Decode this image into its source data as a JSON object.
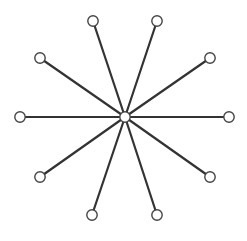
{
  "diagram": {
    "type": "star-graph",
    "width": 247,
    "height": 241,
    "background": "#ffffff",
    "edge_color": "#333333",
    "edge_width": 2.2,
    "node_fill": "#ffffff",
    "node_stroke": "#444444",
    "node_stroke_width": 1.4,
    "node_radius": 5.2,
    "center": {
      "id": "hub",
      "x": 125,
      "y": 117
    },
    "leaves": [
      {
        "id": "leaf-1",
        "x": 93,
        "y": 21
      },
      {
        "id": "leaf-2",
        "x": 157,
        "y": 21
      },
      {
        "id": "leaf-3",
        "x": 210,
        "y": 58
      },
      {
        "id": "leaf-4",
        "x": 229,
        "y": 117
      },
      {
        "id": "leaf-5",
        "x": 210,
        "y": 177
      },
      {
        "id": "leaf-6",
        "x": 157,
        "y": 215
      },
      {
        "id": "leaf-7",
        "x": 92,
        "y": 215
      },
      {
        "id": "leaf-8",
        "x": 40,
        "y": 177
      },
      {
        "id": "leaf-9",
        "x": 20,
        "y": 117
      },
      {
        "id": "leaf-10",
        "x": 40,
        "y": 58
      }
    ]
  }
}
